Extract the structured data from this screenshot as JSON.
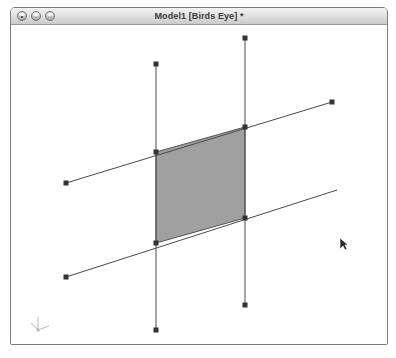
{
  "window": {
    "title": "Model1 [Birds Eye] *",
    "controls": [
      {
        "name": "close",
        "label": "Close"
      },
      {
        "name": "minimize",
        "label": "Minimize"
      },
      {
        "name": "zoom",
        "label": "Zoom"
      }
    ]
  },
  "canvas": {
    "background_color": "#ffffff",
    "line_color": "#4a4a4a",
    "handle_color": "#333333",
    "face_fill_color": "#a0a0a0",
    "face_edge_color": "#555555",
    "axis_gnomon_color": "#b9b9b9",
    "cursor": {
      "x": 340,
      "y": 238,
      "label": "arrow-pointer"
    },
    "face": {
      "label": "shaded-quad-face",
      "points": "156,152 245,127 245,218 156,243"
    },
    "edges": [
      {
        "name": "vertical-line-left",
        "x1": 156,
        "y1": 64,
        "x2": 156,
        "y2": 330
      },
      {
        "name": "vertical-line-right",
        "x1": 245,
        "y1": 38,
        "x2": 245,
        "y2": 305
      },
      {
        "name": "diagonal-line-upper",
        "x1": 66,
        "y1": 183,
        "x2": 332,
        "y2": 102
      },
      {
        "name": "diagonal-line-lower",
        "x1": 66,
        "y1": 277,
        "x2": 337,
        "y2": 190
      }
    ],
    "handles": [
      {
        "name": "handle-vertical-left-top",
        "x": 156,
        "y": 64
      },
      {
        "name": "handle-vertical-left-bottom",
        "x": 156,
        "y": 330
      },
      {
        "name": "handle-vertical-right-top",
        "x": 245,
        "y": 38
      },
      {
        "name": "handle-vertical-right-bottom",
        "x": 245,
        "y": 305
      },
      {
        "name": "handle-diagonal-upper-left",
        "x": 66,
        "y": 183
      },
      {
        "name": "handle-diagonal-upper-right",
        "x": 332,
        "y": 102
      },
      {
        "name": "handle-diagonal-lower-left",
        "x": 66,
        "y": 277
      },
      {
        "name": "vertex-face-top-left",
        "x": 156,
        "y": 152
      },
      {
        "name": "vertex-face-top-right",
        "x": 245,
        "y": 127
      },
      {
        "name": "vertex-face-bottom-right",
        "x": 245,
        "y": 218
      },
      {
        "name": "vertex-face-bottom-left",
        "x": 156,
        "y": 243
      }
    ],
    "gnomon": {
      "x": 38,
      "y": 330,
      "label": "axis-gnomon"
    }
  }
}
